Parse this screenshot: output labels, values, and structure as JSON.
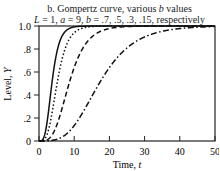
{
  "chart_data": {
    "type": "line",
    "title": "b. Gompertz curve, various b values",
    "subtitle": "L = 1, a = 9, b = .7, .5, .3, .15, respectively",
    "xlabel": "Time, t",
    "ylabel": "Level, Y",
    "xlim": [
      0,
      50
    ],
    "ylim": [
      0,
      1.0
    ],
    "xticks": [
      "0",
      "10",
      "20",
      "30",
      "40",
      "50"
    ],
    "yticks": [
      "0",
      ".2",
      ".4",
      ".6",
      ".8",
      "1.0"
    ],
    "grid": false,
    "legend": null,
    "formula": "Y = L * exp(-a * exp(-b * t))",
    "params": {
      "L": 1,
      "a": 9
    },
    "series": [
      {
        "name": "b = .7",
        "b": 0.7,
        "style": "solid"
      },
      {
        "name": "b = .5",
        "b": 0.5,
        "style": "dotted"
      },
      {
        "name": "b = .3",
        "b": 0.3,
        "style": "dashed"
      },
      {
        "name": "b = .15",
        "b": 0.15,
        "style": "dash-dot"
      }
    ]
  }
}
